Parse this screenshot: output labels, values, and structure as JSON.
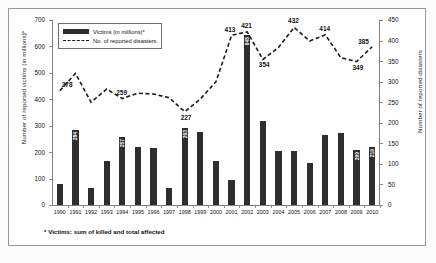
{
  "chart_data": {
    "type": "bar",
    "title": "",
    "categories": [
      "1990",
      "1991",
      "1992",
      "1993",
      "1994",
      "1995",
      "1996",
      "1997",
      "1998",
      "1999",
      "2000",
      "2001",
      "2002",
      "2003",
      "2004",
      "2005",
      "2006",
      "2007",
      "2008",
      "2009",
      "2010"
    ],
    "xlabel": "",
    "ylabel": "Number of reported victims (in millions)*",
    "ylabel_secondary": "Number of reported disasters",
    "ylim": [
      0,
      700
    ],
    "ylim_secondary": [
      0,
      450
    ],
    "yticks": [
      0,
      100,
      200,
      300,
      400,
      500,
      600,
      700
    ],
    "yticks_secondary": [
      0,
      50,
      100,
      150,
      200,
      250,
      300,
      350,
      400,
      450
    ],
    "grid": false,
    "legend_position": "top-left",
    "series": [
      {
        "name": "Victims (in millions)*",
        "kind": "bar",
        "axis": "left",
        "color": "#2e2e2e",
        "values": [
          80,
          284,
          65,
          168,
          257,
          218,
          216,
          65,
          293,
          278,
          167,
          95,
          645,
          318,
          205,
          203,
          160,
          265,
          272,
          209,
          219
        ],
        "point_labels": {
          "1991": "284",
          "1994": "257",
          "1998": "293",
          "2002": "645",
          "2009": "209",
          "2010": "219"
        }
      },
      {
        "name": "No. of reported disasters",
        "kind": "line",
        "axis": "right",
        "color": "#1a1a1a",
        "style": "dashed",
        "values": [
          278,
          320,
          250,
          282,
          259,
          272,
          270,
          261,
          227,
          258,
          300,
          413,
          421,
          354,
          383,
          432,
          399,
          414,
          358,
          349,
          385
        ],
        "point_labels": {
          "1990": "278",
          "1994": "259",
          "1998": "227",
          "2001": "413",
          "2002": "421",
          "2003": "354",
          "2005": "432",
          "2007": "414",
          "2009": "349",
          "2010": "385"
        }
      }
    ],
    "footnote": "* Victims: sum of killed and total affected"
  },
  "legend": {
    "bars_label": "Victims (in millions)*",
    "line_label": "No. of reported disasters"
  }
}
